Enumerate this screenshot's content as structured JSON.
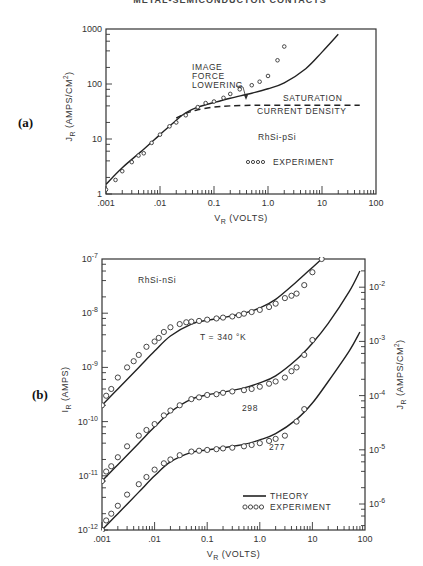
{
  "page": {
    "running_header": "METAL-SEMICONDUCTOR CONTACTS"
  },
  "chart_data": [
    {
      "id": "a",
      "panel_label": "(a)",
      "type": "line",
      "title": "",
      "xlabel": "V_R (VOLTS)",
      "ylabel": "J_R (AMPS/CM^2)",
      "xscale": "log",
      "yscale": "log",
      "xlim": [
        0.001,
        100
      ],
      "ylim": [
        1,
        1000
      ],
      "x_tick_labels": [
        ".001",
        ".01",
        "0.1",
        "1.0",
        "10",
        "100"
      ],
      "y_tick_labels": [
        "1",
        "10",
        "100",
        "1000"
      ],
      "annotations": [
        "IMAGE FORCE LOWERING",
        "SATURATION CURRENT DENSITY",
        "RhSi-pSi"
      ],
      "legend": [
        "EXPERIMENT"
      ],
      "series": [
        {
          "name": "Theory (with image force lowering)",
          "style": "solid",
          "x": [
            0.001,
            0.002,
            0.005,
            0.01,
            0.02,
            0.03,
            0.05,
            0.1,
            0.2,
            0.5,
            1.0,
            2.0,
            5.0,
            10,
            20
          ],
          "y": [
            1.5,
            3.0,
            6.5,
            12,
            22,
            30,
            38,
            46,
            55,
            68,
            82,
            105,
            190,
            380,
            800
          ]
        },
        {
          "name": "Saturation current density",
          "style": "dashed",
          "x": [
            0.02,
            0.03,
            0.05,
            0.1,
            0.2,
            0.5,
            1.0,
            5.0,
            10,
            50
          ],
          "y": [
            24,
            29,
            34,
            38,
            40,
            41,
            41,
            41,
            41,
            41
          ]
        },
        {
          "name": "EXPERIMENT",
          "style": "circles",
          "x": [
            0.001,
            0.0015,
            0.002,
            0.003,
            0.004,
            0.005,
            0.007,
            0.01,
            0.015,
            0.02,
            0.03,
            0.05,
            0.07,
            0.1,
            0.15,
            0.2,
            0.3,
            0.5,
            0.7,
            1.0,
            1.5,
            2.0
          ],
          "y": [
            1.2,
            1.8,
            2.6,
            3.8,
            5.0,
            5.5,
            8.5,
            12,
            17,
            20,
            27,
            38,
            45,
            48,
            56,
            66,
            80,
            95,
            110,
            140,
            270,
            480
          ]
        }
      ]
    },
    {
      "id": "b",
      "panel_label": "(b)",
      "type": "line",
      "title": "",
      "xlabel": "V_R (VOLTS)",
      "ylabel": "I_R (AMPS)",
      "ylabel_right": "J_R (AMPS/CM^2)",
      "xscale": "log",
      "yscale": "log",
      "xlim": [
        0.001,
        100
      ],
      "ylim": [
        1e-12,
        1e-07
      ],
      "ylim_right": [
        1e-06,
        0.01
      ],
      "x_tick_labels": [
        ".001",
        ".01",
        "0.1",
        "1.0",
        "10",
        "100"
      ],
      "y_tick_labels": [
        "10^-12",
        "10^-11",
        "10^-10",
        "10^-9",
        "10^-8",
        "10^-7"
      ],
      "y_right_tick_labels": [
        "10^-6",
        "10^-5",
        "10^-4",
        "10^-3",
        "10^-2"
      ],
      "annotations": [
        "RhSi-nSi",
        "T = 340 °K",
        "298",
        "277"
      ],
      "legend": [
        "THEORY",
        "EXPERIMENT"
      ],
      "series": [
        {
          "name": "Theory T=340K",
          "style": "solid",
          "x": [
            0.001,
            0.002,
            0.005,
            0.01,
            0.02,
            0.05,
            0.1,
            0.2,
            0.5,
            1.0,
            2.0,
            5.0,
            10,
            15
          ],
          "y": [
            2e-10,
            4e-10,
            1e-09,
            2e-09,
            3.8e-09,
            6.3e-09,
            7.4e-09,
            8.3e-09,
            1e-08,
            1.25e-08,
            1.8e-08,
            3.8e-08,
            7e-08,
            1e-07
          ]
        },
        {
          "name": "Experiment T=340K",
          "style": "circles",
          "x": [
            0.001,
            0.0012,
            0.0015,
            0.002,
            0.003,
            0.004,
            0.005,
            0.007,
            0.01,
            0.012,
            0.015,
            0.02,
            0.03,
            0.04,
            0.05,
            0.07,
            0.1,
            0.15,
            0.2,
            0.3,
            0.4,
            0.5,
            0.7,
            1.0,
            1.5,
            2.0,
            3.0,
            4.0,
            5.0,
            7.0,
            10,
            15
          ],
          "y": [
            2e-10,
            3e-10,
            4e-10,
            6.5e-10,
            1e-09,
            1.3e-09,
            1.7e-09,
            2.4e-09,
            3e-09,
            3.5e-09,
            4.5e-09,
            5.5e-09,
            6.3e-09,
            6.8e-09,
            7e-09,
            7.2e-09,
            7.6e-09,
            8e-09,
            8.3e-09,
            8.7e-09,
            9.2e-09,
            9.8e-09,
            1.05e-08,
            1.15e-08,
            1.3e-08,
            1.5e-08,
            1.9e-08,
            2.1e-08,
            2.3e-08,
            3.3e-08,
            5.7e-08,
            1e-07
          ]
        },
        {
          "name": "Theory T=298K",
          "style": "solid",
          "x": [
            0.001,
            0.002,
            0.005,
            0.01,
            0.02,
            0.05,
            0.1,
            0.2,
            0.5,
            1.0,
            2.0,
            5.0,
            10,
            20,
            50,
            80
          ],
          "y": [
            8e-12,
            1.6e-11,
            4e-11,
            8e-11,
            1.5e-10,
            2.6e-10,
            3.1e-10,
            3.5e-10,
            4.2e-10,
            5.2e-10,
            7e-10,
            1.4e-09,
            2.8e-09,
            6.5e-09,
            2.5e-08,
            6e-08
          ]
        },
        {
          "name": "Experiment T=298K",
          "style": "circles",
          "x": [
            0.001,
            0.0012,
            0.0015,
            0.002,
            0.003,
            0.005,
            0.007,
            0.01,
            0.015,
            0.02,
            0.03,
            0.05,
            0.07,
            0.1,
            0.15,
            0.2,
            0.3,
            0.5,
            0.7,
            1.0,
            1.5,
            2.0,
            3.0,
            4.0,
            5.0,
            7.0,
            10
          ],
          "y": [
            8e-12,
            1.2e-11,
            1.5e-11,
            2.2e-11,
            3.5e-11,
            5.5e-11,
            7e-11,
            9e-11,
            1.3e-10,
            1.6e-10,
            2e-10,
            2.6e-10,
            2.8e-10,
            3.1e-10,
            3.2e-10,
            3.4e-10,
            3.6e-10,
            3.8e-10,
            4e-10,
            4.4e-10,
            5e-10,
            5.5e-10,
            6.5e-10,
            8.5e-10,
            1e-09,
            1.7e-09,
            3.2e-09
          ]
        },
        {
          "name": "Theory T=277K",
          "style": "solid",
          "x": [
            0.001,
            0.002,
            0.005,
            0.01,
            0.02,
            0.05,
            0.1,
            0.2,
            0.5,
            1.0,
            2.0,
            5.0,
            10,
            20,
            50,
            80
          ],
          "y": [
            1e-12,
            2e-12,
            5e-12,
            1e-11,
            1.8e-11,
            2.7e-11,
            3e-11,
            3.3e-11,
            3.8e-11,
            4.6e-11,
            6e-11,
            1.1e-10,
            2.2e-10,
            5.5e-10,
            2e-09,
            4.5e-09
          ]
        },
        {
          "name": "Experiment T=277K",
          "style": "circles",
          "x": [
            0.001,
            0.0012,
            0.0015,
            0.002,
            0.003,
            0.005,
            0.007,
            0.01,
            0.015,
            0.02,
            0.03,
            0.05,
            0.07,
            0.1,
            0.15,
            0.2,
            0.3,
            0.5,
            0.7,
            1.0,
            1.5,
            2.0,
            3.0,
            5.0,
            7.0
          ],
          "y": [
            1e-12,
            1.5e-12,
            2e-12,
            2.8e-12,
            4.5e-12,
            7e-12,
            9.5e-12,
            1.3e-11,
            1.7e-11,
            2e-11,
            2.4e-11,
            2.8e-11,
            2.9e-11,
            3e-11,
            3.1e-11,
            3.2e-11,
            3.3e-11,
            3.5e-11,
            3.7e-11,
            4e-11,
            4.4e-11,
            4.8e-11,
            5.5e-11,
            1e-10,
            1.7e-10
          ]
        }
      ]
    }
  ]
}
